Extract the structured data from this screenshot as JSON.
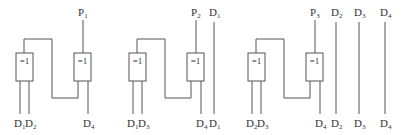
{
  "diagram": {
    "line_color": "#555555",
    "gate_label": "=1",
    "blocks": [
      {
        "offset": 0,
        "parity_label": "P",
        "parity_sub": "1",
        "in1": {
          "base": "D",
          "sub": "1"
        },
        "in2": {
          "base": "D",
          "sub": "2"
        },
        "in3": {
          "base": "D",
          "sub": "4"
        }
      },
      {
        "offset": 113,
        "parity_label": "P",
        "parity_sub": "2",
        "in1": {
          "base": "D",
          "sub": "1"
        },
        "in2": {
          "base": "D",
          "sub": "3"
        },
        "in3": {
          "base": "D",
          "sub": "4"
        }
      },
      {
        "offset": 232,
        "parity_label": "P",
        "parity_sub": "3",
        "in1": {
          "base": "D",
          "sub": "2"
        },
        "in2": {
          "base": "D",
          "sub": "3"
        },
        "in3": {
          "base": "D",
          "sub": "4"
        }
      }
    ],
    "passthrough": [
      {
        "x": 214,
        "base": "D",
        "sub": "1"
      },
      {
        "x": 336,
        "base": "D",
        "sub": "2"
      },
      {
        "x": 359,
        "base": "D",
        "sub": "3"
      },
      {
        "x": 385,
        "base": "D",
        "sub": "4"
      }
    ]
  }
}
